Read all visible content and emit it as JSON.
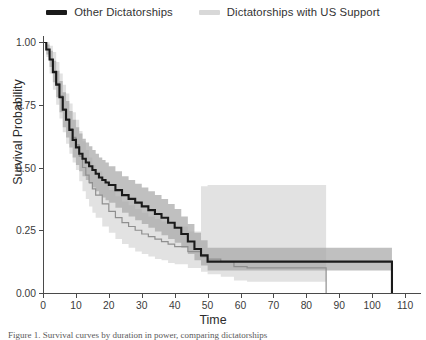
{
  "legend": {
    "position": "top-center",
    "entries": [
      {
        "label": "Other Dictatorships",
        "color": "#1a1a1a",
        "name": "other-dictatorships"
      },
      {
        "label": "Dictatorships with US Support",
        "color": "#d8d8d8",
        "name": "us-supported-dictatorships"
      }
    ]
  },
  "caption": {
    "text": "Figure 1. Survival curves by duration in power, comparing dictatorships"
  },
  "chart_data": {
    "type": "line",
    "subtype": "kaplan-meier-survival",
    "title": "",
    "xlabel": "Time",
    "ylabel": "Survival Probability",
    "xlim": [
      0,
      113
    ],
    "ylim": [
      0.0,
      1.0
    ],
    "xticks": [
      0,
      10,
      20,
      30,
      40,
      50,
      60,
      70,
      80,
      90,
      100,
      110
    ],
    "xticklabels": [
      "0",
      "10",
      "20",
      "30",
      "40",
      "50",
      "60",
      "70",
      "80",
      "90",
      "100",
      "110"
    ],
    "yticks": [
      0.0,
      0.25,
      0.5,
      0.75,
      1.0
    ],
    "yticklabels": [
      "0.00",
      "0.25",
      "0.50",
      "0.75",
      "1.00"
    ],
    "grid": false,
    "colors": {
      "other_line": "#1a1a1a",
      "other_band": "#a8a8a8",
      "us_line": "#8f8f8f",
      "us_band": "#e2e2e2",
      "axis": "#4a4a4a",
      "text": "#2b2b2b"
    },
    "series": [
      {
        "name": "Other Dictatorships",
        "color": "#1a1a1a",
        "band_color": "#a8a8a8",
        "x": [
          0,
          1,
          2,
          3,
          4,
          5,
          6,
          7,
          8,
          9,
          10,
          11,
          12,
          13,
          14,
          15,
          16,
          17,
          18,
          19,
          20,
          22,
          24,
          26,
          28,
          30,
          32,
          34,
          36,
          38,
          40,
          42,
          44,
          46,
          48,
          50,
          86,
          106
        ],
        "values": [
          1.0,
          0.97,
          0.93,
          0.88,
          0.83,
          0.78,
          0.73,
          0.69,
          0.65,
          0.61,
          0.58,
          0.555,
          0.535,
          0.52,
          0.505,
          0.49,
          0.475,
          0.46,
          0.45,
          0.44,
          0.43,
          0.41,
          0.39,
          0.375,
          0.36,
          0.345,
          0.33,
          0.315,
          0.3,
          0.28,
          0.26,
          0.235,
          0.205,
          0.175,
          0.15,
          0.125,
          0.125,
          0.0
        ],
        "ci_lower": [
          1.0,
          0.95,
          0.9,
          0.84,
          0.78,
          0.72,
          0.66,
          0.62,
          0.58,
          0.54,
          0.51,
          0.485,
          0.465,
          0.45,
          0.435,
          0.42,
          0.405,
          0.39,
          0.38,
          0.37,
          0.36,
          0.34,
          0.32,
          0.305,
          0.29,
          0.275,
          0.26,
          0.245,
          0.23,
          0.215,
          0.2,
          0.18,
          0.155,
          0.13,
          0.11,
          0.09,
          0.09,
          0.0
        ],
        "ci_upper": [
          1.0,
          0.99,
          0.965,
          0.925,
          0.885,
          0.845,
          0.8,
          0.765,
          0.725,
          0.69,
          0.66,
          0.635,
          0.615,
          0.6,
          0.585,
          0.57,
          0.555,
          0.54,
          0.53,
          0.52,
          0.505,
          0.485,
          0.465,
          0.45,
          0.435,
          0.42,
          0.405,
          0.39,
          0.375,
          0.355,
          0.335,
          0.305,
          0.275,
          0.24,
          0.21,
          0.18,
          0.18,
          0.0
        ]
      },
      {
        "name": "Dictatorships with US Support",
        "color": "#8f8f8f",
        "band_color": "#e2e2e2",
        "x": [
          0,
          1,
          2,
          3,
          4,
          5,
          6,
          7,
          8,
          9,
          10,
          11,
          12,
          13,
          14,
          15,
          16,
          18,
          20,
          22,
          24,
          26,
          28,
          30,
          32,
          34,
          36,
          38,
          40,
          44,
          48,
          50,
          54,
          58,
          62,
          86
        ],
        "values": [
          1.0,
          0.97,
          0.93,
          0.885,
          0.835,
          0.785,
          0.735,
          0.695,
          0.655,
          0.62,
          0.59,
          0.545,
          0.5,
          0.47,
          0.44,
          0.415,
          0.39,
          0.355,
          0.325,
          0.3,
          0.28,
          0.265,
          0.25,
          0.235,
          0.225,
          0.215,
          0.205,
          0.195,
          0.185,
          0.165,
          0.145,
          0.135,
          0.125,
          0.105,
          0.1,
          0.0
        ],
        "ci_lower": [
          1.0,
          0.94,
          0.875,
          0.81,
          0.75,
          0.695,
          0.64,
          0.595,
          0.555,
          0.52,
          0.49,
          0.445,
          0.405,
          0.375,
          0.345,
          0.32,
          0.3,
          0.265,
          0.24,
          0.215,
          0.195,
          0.18,
          0.165,
          0.155,
          0.145,
          0.135,
          0.13,
          0.12,
          0.115,
          0.1,
          0.085,
          0.075,
          0.065,
          0.05,
          0.045,
          0.0
        ],
        "ci_upper": [
          1.0,
          1.0,
          0.985,
          0.96,
          0.92,
          0.875,
          0.83,
          0.795,
          0.755,
          0.72,
          0.69,
          0.645,
          0.605,
          0.57,
          0.54,
          0.51,
          0.485,
          0.445,
          0.41,
          0.385,
          0.365,
          0.35,
          0.335,
          0.32,
          0.305,
          0.295,
          0.285,
          0.275,
          0.265,
          0.245,
          0.425,
          0.43,
          0.43,
          0.43,
          0.43,
          0.43
        ]
      }
    ]
  }
}
